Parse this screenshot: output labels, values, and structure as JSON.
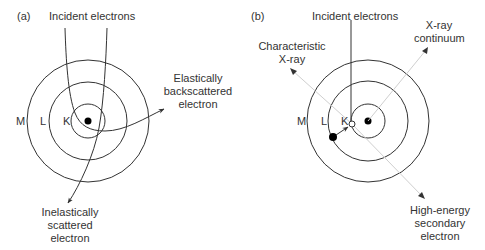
{
  "panel_a": {
    "label": "(a)",
    "incident": "Incident electrons",
    "elastic": "Elastically\nbackscattered\nelectron",
    "inelastic": "Inelastically\nscattered\nelectron",
    "shells": {
      "m": "M",
      "l": "L",
      "k": "K"
    }
  },
  "panel_b": {
    "label": "(b)",
    "incident": "Incident electrons",
    "characteristic": "Characteristic\nX-ray",
    "continuum": "X-ray\ncontinuum",
    "secondary": "High-energy\nsecondary\nelectron",
    "shells": {
      "m": "M",
      "l": "L",
      "k": "K"
    }
  },
  "colors": {
    "line": "#333333",
    "light_line": "#cccccc",
    "text": "#333333"
  }
}
